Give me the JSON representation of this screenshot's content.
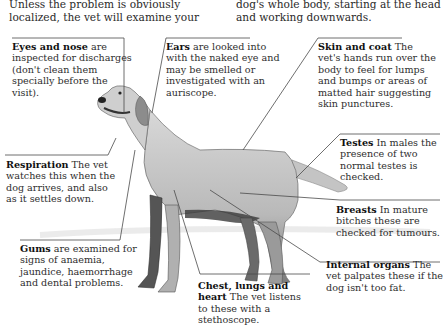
{
  "intro": {
    "left": "Unless the problem is obviously localized, the vet will examine your",
    "right": "dog's whole body, starting at the head and working downwards."
  },
  "callouts": {
    "eyes_nose": {
      "title": "Eyes and nose",
      "text": " are inspected for discharges (don't clean them specially before the visit)."
    },
    "ears": {
      "title": "Ears",
      "text": " are looked into with the naked eye and may be smelled or investigated with an auriscope."
    },
    "skin_coat": {
      "title": "Skin and coat",
      "text": " The vet's hands run over the body to feel for lumps and bumps or areas of matted hair suggesting skin punctures."
    },
    "respiration": {
      "title": "Respiration",
      "text": " The vet watches this when the dog arrives, and also as it settles down."
    },
    "testes": {
      "title": "Testes",
      "text": " In males the presence of two normal testes is checked."
    },
    "breasts": {
      "title": "Breasts",
      "text": " In mature bitches these are checked for tumours."
    },
    "gums": {
      "title": "Gums",
      "text": " are examined for signs of anaemia, jaundice, haemorrhage and dental problems."
    },
    "internal_organs": {
      "title": "Internal organs",
      "text": " The vet palpates these if the dog isn't too fat."
    },
    "chest": {
      "title": "Chest, lungs and heart",
      "text": " The vet listens to these with a stethoscope."
    }
  },
  "illustration": {
    "subject": "labrador-retriever-standing",
    "line_color": "#4a4a4a"
  }
}
